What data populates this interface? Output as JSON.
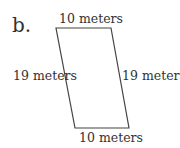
{
  "problem": {
    "label": "b.",
    "shape": "parallelogram",
    "sides": {
      "top": "10 meters",
      "left": "19 meters",
      "right": "19 meters",
      "bottom": "10 meters"
    }
  }
}
